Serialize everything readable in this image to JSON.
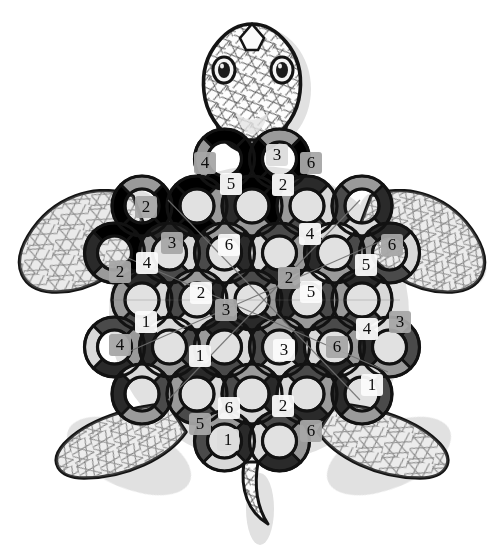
{
  "artwork": {
    "title": "Sea Turtle Ring Puzzle",
    "subject": "sea-turtle",
    "style": "black-and-white line drawing with grayscale shading",
    "background_color": "#ffffff",
    "outline_color": "#111111",
    "shadow_color": "#b8b8b8",
    "palette": {
      "white": "#fdfdfd",
      "light_gray": "#d9d9d9",
      "mid_gray": "#9a9a9a",
      "dark_gray": "#4a4a4a",
      "near_black": "#2a2a2a",
      "outline": "#121212",
      "hatch": "#6f6f6f"
    }
  },
  "turtle": {
    "head": {
      "name": "head",
      "eyes": 2,
      "eye_color": "#f2f2f2",
      "pupil_color": "#1a1a1a",
      "texture": "crosshatch"
    },
    "flippers": [
      {
        "name": "front-left-flipper",
        "position": "upper-left",
        "texture": "crosshatch"
      },
      {
        "name": "front-right-flipper",
        "position": "upper-right",
        "texture": "crosshatch"
      },
      {
        "name": "rear-left-flipper",
        "position": "lower-left",
        "texture": "crosshatch"
      },
      {
        "name": "rear-right-flipper",
        "position": "lower-right",
        "texture": "crosshatch"
      }
    ],
    "tail": {
      "name": "tail",
      "position": "bottom-center",
      "texture": "crosshatch"
    }
  },
  "shell": {
    "description": "Interlocking rings forming the carapace; each ring is split into shaded arc segments, some bearing a digit.",
    "digit_set": [
      1,
      2,
      3,
      4,
      5,
      6
    ],
    "numbers": [
      {
        "id": "n01",
        "value": "4",
        "x": 205,
        "y": 163,
        "tone": "mid"
      },
      {
        "id": "n02",
        "value": "3",
        "x": 277,
        "y": 155,
        "tone": "light"
      },
      {
        "id": "n03",
        "value": "6",
        "x": 311,
        "y": 163,
        "tone": "mid"
      },
      {
        "id": "n04",
        "value": "5",
        "x": 231,
        "y": 184,
        "tone": "white"
      },
      {
        "id": "n05",
        "value": "2",
        "x": 283,
        "y": 185,
        "tone": "white"
      },
      {
        "id": "n06",
        "value": "2",
        "x": 146,
        "y": 207,
        "tone": "mid"
      },
      {
        "id": "n07",
        "value": "3",
        "x": 172,
        "y": 243,
        "tone": "mid"
      },
      {
        "id": "n08",
        "value": "6",
        "x": 229,
        "y": 245,
        "tone": "white"
      },
      {
        "id": "n09",
        "value": "4",
        "x": 310,
        "y": 234,
        "tone": "white"
      },
      {
        "id": "n10",
        "value": "6",
        "x": 392,
        "y": 245,
        "tone": "mid"
      },
      {
        "id": "n11",
        "value": "2",
        "x": 120,
        "y": 272,
        "tone": "mid"
      },
      {
        "id": "n12",
        "value": "4",
        "x": 147,
        "y": 263,
        "tone": "white"
      },
      {
        "id": "n13",
        "value": "2",
        "x": 289,
        "y": 278,
        "tone": "mid"
      },
      {
        "id": "n14",
        "value": "5",
        "x": 366,
        "y": 265,
        "tone": "white"
      },
      {
        "id": "n15",
        "value": "2",
        "x": 201,
        "y": 293,
        "tone": "white"
      },
      {
        "id": "n16",
        "value": "5",
        "x": 311,
        "y": 292,
        "tone": "white"
      },
      {
        "id": "n17",
        "value": "3",
        "x": 226,
        "y": 310,
        "tone": "mid"
      },
      {
        "id": "n18",
        "value": "1",
        "x": 146,
        "y": 322,
        "tone": "white"
      },
      {
        "id": "n19",
        "value": "4",
        "x": 367,
        "y": 329,
        "tone": "white"
      },
      {
        "id": "n20",
        "value": "3",
        "x": 400,
        "y": 322,
        "tone": "mid"
      },
      {
        "id": "n21",
        "value": "4",
        "x": 120,
        "y": 345,
        "tone": "mid"
      },
      {
        "id": "n22",
        "value": "1",
        "x": 200,
        "y": 356,
        "tone": "white"
      },
      {
        "id": "n23",
        "value": "3",
        "x": 284,
        "y": 350,
        "tone": "white"
      },
      {
        "id": "n24",
        "value": "6",
        "x": 337,
        "y": 347,
        "tone": "mid"
      },
      {
        "id": "n25",
        "value": "1",
        "x": 372,
        "y": 385,
        "tone": "white"
      },
      {
        "id": "n26",
        "value": "6",
        "x": 229,
        "y": 408,
        "tone": "white"
      },
      {
        "id": "n27",
        "value": "2",
        "x": 283,
        "y": 406,
        "tone": "white"
      },
      {
        "id": "n28",
        "value": "5",
        "x": 200,
        "y": 424,
        "tone": "mid"
      },
      {
        "id": "n29",
        "value": "6",
        "x": 311,
        "y": 431,
        "tone": "mid"
      },
      {
        "id": "n30",
        "value": "1",
        "x": 228,
        "y": 440,
        "tone": "light"
      }
    ]
  }
}
